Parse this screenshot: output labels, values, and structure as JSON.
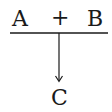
{
  "diagram": {
    "reactants": [
      "A",
      "B"
    ],
    "operator": "+",
    "product": "C",
    "colors": {
      "ink": "#1a1a1a",
      "background": "#ffffff"
    }
  }
}
